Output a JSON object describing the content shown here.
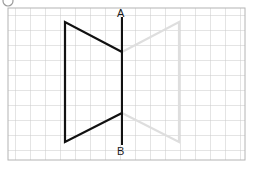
{
  "figure": {
    "title_marker": "corner-circle-marker",
    "canvas": {
      "width": 253,
      "height": 169,
      "background": "#ffffff"
    },
    "grid": {
      "x0": 8,
      "y0": 8,
      "x1": 245,
      "y1": 160,
      "cell": 15,
      "line_color": "#c9c9c9",
      "border_color": "#b4b4b4",
      "visible": true
    },
    "mirror_line": {
      "name": "line-AB",
      "x": 122,
      "y_top": 17,
      "y_bottom": 145,
      "color": "#111111",
      "width": 2,
      "endpoint_top_label": "A",
      "endpoint_bottom_label": "B"
    },
    "shapes": [
      {
        "name": "original-trapezoid",
        "color": "#111111",
        "width": 2.2,
        "closed": false,
        "points": [
          {
            "x": 122,
            "y": 52
          },
          {
            "x": 65,
            "y": 22
          },
          {
            "x": 65,
            "y": 142
          },
          {
            "x": 122,
            "y": 113
          }
        ]
      },
      {
        "name": "reflected-trapezoid",
        "color": "#dedede",
        "width": 2.2,
        "closed": false,
        "points": [
          {
            "x": 122,
            "y": 52
          },
          {
            "x": 179,
            "y": 22
          },
          {
            "x": 179,
            "y": 142
          },
          {
            "x": 122,
            "y": 113
          }
        ]
      }
    ],
    "corner_marker": {
      "name": "circle-marker",
      "cx": 8,
      "cy": 1,
      "r": 5,
      "stroke": "#9a9a9a"
    }
  }
}
